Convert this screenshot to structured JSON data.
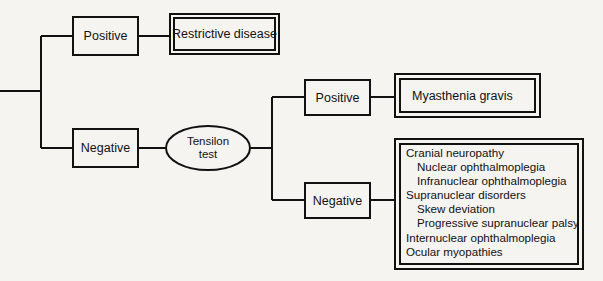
{
  "diagram": {
    "background_color": "#f6f4f1",
    "line_color": "#111111",
    "nodes": {
      "positive_top": {
        "label": "Positive",
        "shape": "rect"
      },
      "restrictive_disease": {
        "label": "Restrictive disease",
        "shape": "double-rect"
      },
      "negative_top": {
        "label": "Negative",
        "shape": "rect"
      },
      "tensilon_test": {
        "label_line1": "Tensilon",
        "label_line2": "test",
        "shape": "ellipse"
      },
      "positive_branch": {
        "label": "Positive",
        "shape": "rect"
      },
      "myasthenia_gravis": {
        "label": "Myasthenia gravis",
        "shape": "double-rect"
      },
      "negative_branch": {
        "label": "Negative",
        "shape": "rect"
      },
      "differential_list": {
        "shape": "double-rect",
        "items": [
          {
            "text": "Cranial neuropathy",
            "level": 1
          },
          {
            "text": "Nuclear ophthalmoplegia",
            "level": 2
          },
          {
            "text": "Infranuclear ophthalmoplegia",
            "level": 2
          },
          {
            "text": "Supranuclear disorders",
            "level": 1
          },
          {
            "text": "Skew deviation",
            "level": 2
          },
          {
            "text": "Progressive supranuclear palsy",
            "level": 2
          },
          {
            "text": "Internuclear ophthalmoplegia",
            "level": 1
          },
          {
            "text": "Ocular myopathies",
            "level": 1
          }
        ]
      }
    }
  }
}
